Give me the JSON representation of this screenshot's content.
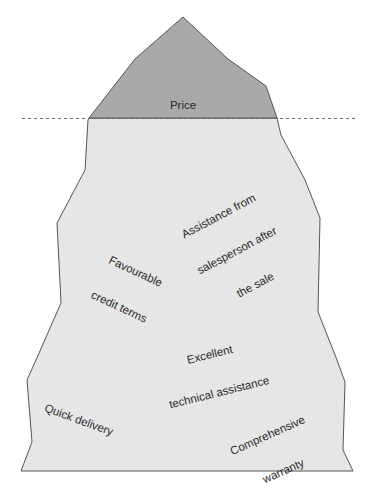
{
  "diagram": {
    "type": "iceberg",
    "colors": {
      "above_water_fill": "#a9a9a9",
      "below_water_fill": "#e6e6e6",
      "outline": "#555555",
      "waterline": "#666666",
      "text": "#2a2a2a"
    },
    "waterline": {
      "style": "dashed"
    },
    "above_water": {
      "label": "Price"
    },
    "below_water": {
      "labels": [
        {
          "id": "assistance",
          "lines": [
            "Assistance from",
            "salesperson after",
            "the sale"
          ]
        },
        {
          "id": "credit",
          "lines": [
            "Favourable",
            "credit terms"
          ]
        },
        {
          "id": "technical",
          "lines": [
            "Excellent",
            "technical assistance"
          ]
        },
        {
          "id": "delivery",
          "lines": [
            "Quick delivery"
          ]
        },
        {
          "id": "warranty",
          "lines": [
            "Comprehensive",
            "warranty"
          ]
        }
      ]
    }
  }
}
